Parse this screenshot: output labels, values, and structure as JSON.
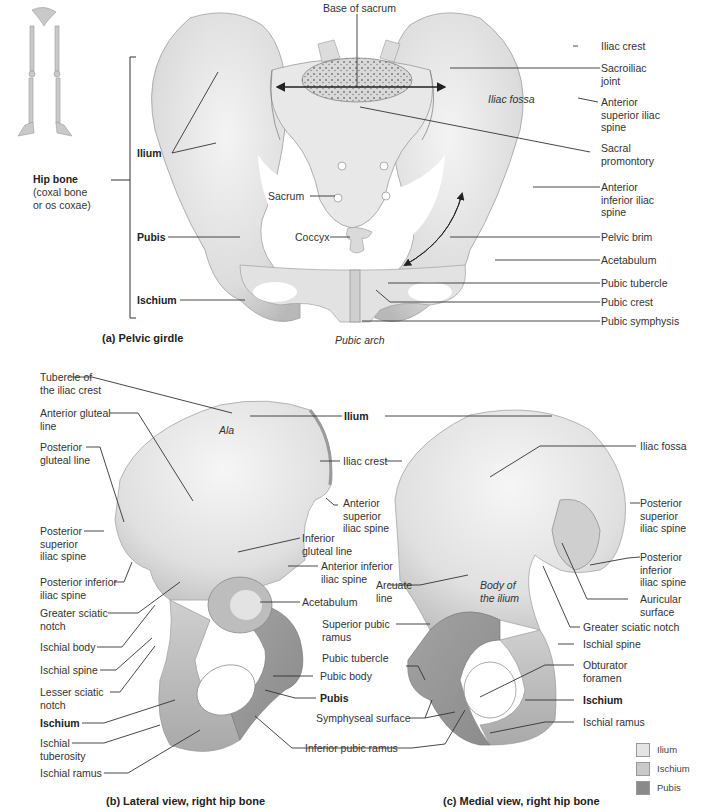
{
  "figure_a": {
    "caption": "(a) Pelvic girdle",
    "hip_bone_label": "Hip bone",
    "hip_bone_sub": "(coxal bone\nor os coxae)",
    "left_labels": {
      "ilium": "Ilium",
      "pubis": "Pubis",
      "ischium": "Ischium"
    },
    "top_label": "Base of sacrum",
    "inner_labels": {
      "iliac_fossa": "Iliac fossa",
      "sacrum": "Sacrum",
      "coccyx": "Coccyx",
      "pubic_arch": "Pubic arch"
    },
    "right_labels": [
      "Iliac crest",
      "Sacroiliac\njoint",
      "Anterior\nsuperior iliac\nspine",
      "Sacral\npromontory",
      "Anterior\ninferior iliac\nspine",
      "Pelvic brim",
      "Acetabulum",
      "Pubic tubercle",
      "Pubic crest",
      "Pubic symphysis"
    ]
  },
  "figure_b": {
    "caption": "(b) Lateral view, right hip bone",
    "left_labels": [
      "Tubercle of\nthe iliac crest",
      "Anterior gluteal\nline",
      "Posterior\ngluteal line",
      "Posterior\nsuperior\niliac spine",
      "Posterior inferior\niliac spine",
      "Greater sciatic\nnotch",
      "Ischial body",
      "Ischial spine",
      "Lesser sciatic\nnotch",
      "Ischium",
      "Ischial\ntuberosity",
      "Ischial ramus"
    ],
    "ala": "Ala",
    "middle_labels": {
      "ilium": "Ilium",
      "iliac_crest": "Iliac crest",
      "asis": "Anterior\nsuperior\niliac spine",
      "inferior_gluteal": "Inferior\ngluteal line",
      "aiis": "Anterior inferior\niliac spine",
      "acetabulum": "Acetabulum",
      "superior_pubic_ramus": "Superior pubic\nramus",
      "pubic_tubercle": "Pubic tubercle",
      "pubic_body": "Pubic body",
      "pubis": "Pubis",
      "symphyseal_surface": "Symphyseal surface",
      "inferior_pubic_ramus": "Inferior pubic ramus"
    }
  },
  "figure_c": {
    "caption": "(c) Medial view, right hip bone",
    "arcuate_line": "Arcuate\nline",
    "body_of_ilium": "Body of\nthe ilium",
    "right_labels": [
      "Iliac fossa",
      "Posterior\nsuperior\niliac spine",
      "Posterior\ninferior\niliac spine",
      "Auricular\nsurface",
      "Greater sciatic notch",
      "Ischial spine",
      "Obturator\nforamen",
      "Ischium",
      "Ischial ramus"
    ]
  },
  "legend": [
    {
      "label": "Ilium",
      "color": "#e4e4e4"
    },
    {
      "label": "Ischium",
      "color": "#c9c9c9"
    },
    {
      "label": "Pubis",
      "color": "#8a8a8a"
    }
  ]
}
